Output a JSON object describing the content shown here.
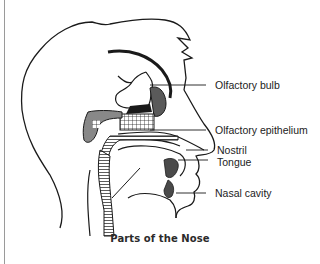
{
  "figure": {
    "caption": "Parts of the Nose",
    "labels": [
      {
        "id": "olfactory-bulb",
        "text": "Olfactory bulb"
      },
      {
        "id": "olfactory-epithelium",
        "text": "Olfactory epithelium"
      },
      {
        "id": "nostril",
        "text": "Nostril"
      },
      {
        "id": "tongue",
        "text": "Tongue"
      },
      {
        "id": "nasal-cavity",
        "text": "Nasal cavity"
      }
    ]
  },
  "colors": {
    "line": "#1a1a1a",
    "text": "#222222",
    "fill_dark": "#2b2b2b",
    "fill_gray": "#8a8a8a",
    "rule": "#9a9a9a"
  }
}
